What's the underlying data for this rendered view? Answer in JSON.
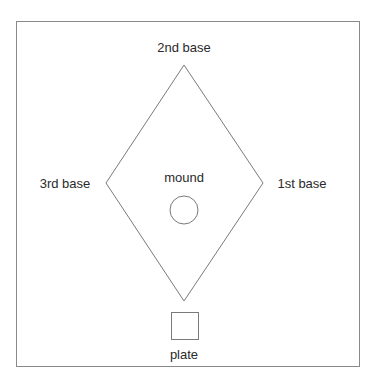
{
  "diagram": {
    "labels": {
      "second_base": "2nd base",
      "third_base": "3rd base",
      "first_base": "1st base",
      "mound": "mound",
      "plate": "plate"
    },
    "colors": {
      "stroke": "#7a7a7a",
      "frame": "#8a8a8a",
      "text": "#2a2a2a",
      "background": "#ffffff"
    }
  }
}
